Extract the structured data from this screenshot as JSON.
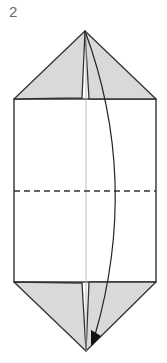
{
  "diagram": {
    "type": "origami-step",
    "step_number": "2",
    "colors": {
      "paper_white": "#ffffff",
      "flap_gray": "#d9d9d9",
      "line": "#333333",
      "center_crease": "#b5b5b5",
      "step_text": "#6b6b6b"
    },
    "elements": {
      "top_flaps": "Two gray triangular flaps folded to top point",
      "body": "White rectangle body",
      "fold_line": "Horizontal dashed valley-fold line across middle",
      "center_crease": "Thin vertical crease down the center",
      "bottom_flaps": "Two gray triangular flaps at bottom point",
      "arrow": "Curved arrow from top point down to bottom point indicating fold"
    }
  }
}
